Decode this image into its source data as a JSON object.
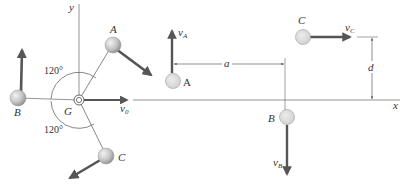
{
  "diagram": {
    "type": "physics-free-body",
    "colors": {
      "line": "#7a7a7a",
      "arrow": "#555555",
      "ball_fill": "#cfcfcf",
      "ball_stroke": "#9a9a9a",
      "text": "#333333"
    },
    "left_figure": {
      "axis_y_label": "y",
      "center_label": "G",
      "velocity_label": "v",
      "velocity_sub": "0",
      "angle_top": "120°",
      "angle_bottom": "120°",
      "balls": [
        {
          "id": "A",
          "label": "A"
        },
        {
          "id": "B",
          "label": "B"
        },
        {
          "id": "C",
          "label": "C"
        }
      ]
    },
    "right_figure": {
      "axis_x_label": "x",
      "dimension_a": "a",
      "dimension_d": "d",
      "balls": [
        {
          "id": "A",
          "label": "A",
          "velocity": "v",
          "velocity_sub": "A"
        },
        {
          "id": "B",
          "label": "B",
          "velocity": "v",
          "velocity_sub": "B"
        },
        {
          "id": "C",
          "label": "C",
          "velocity": "v",
          "velocity_sub": "C"
        }
      ]
    }
  }
}
